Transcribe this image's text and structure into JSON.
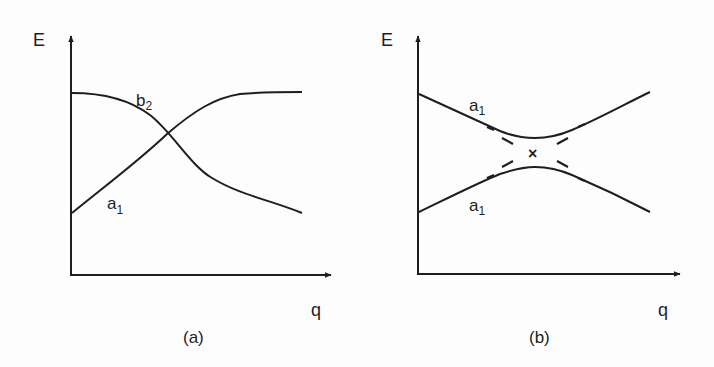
{
  "colors": {
    "line": "#1e1e1e",
    "background": "#fdfdfd"
  },
  "panels": [
    {
      "id": "a",
      "caption": "(a)",
      "y_axis_label": "E",
      "x_axis_label": "q",
      "curves": [
        {
          "name": "b",
          "sub": "2",
          "description": "starts high, decreases through crossing"
        },
        {
          "name": "a",
          "sub": "1",
          "description": "starts low, increases through crossing"
        }
      ]
    },
    {
      "id": "b",
      "caption": "(b)",
      "y_axis_label": "E",
      "x_axis_label": "q",
      "curves": [
        {
          "name": "a",
          "sub": "1",
          "description": "upper branch, avoided crossing"
        },
        {
          "name": "a",
          "sub": "1",
          "description": "lower branch, avoided crossing"
        }
      ],
      "crossing_marker": "×"
    }
  ]
}
